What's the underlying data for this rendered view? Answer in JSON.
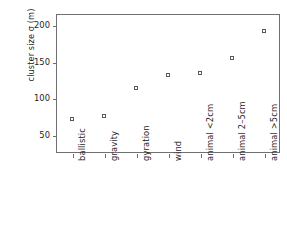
{
  "chart_data": {
    "type": "scatter",
    "title": "",
    "xlabel": "",
    "ylabel": "cluster size σ (m)",
    "categories": [
      "ballistic",
      "gravity",
      "gyration",
      "wind",
      "animal <2cm",
      "animal 2–5cm",
      "animal >5cm"
    ],
    "values": [
      72,
      76,
      114,
      132,
      134,
      155,
      192
    ],
    "ytick_labels": [
      "50",
      "100",
      "150",
      "200"
    ],
    "ytick_values": [
      50,
      100,
      150,
      200
    ],
    "ylim": [
      25,
      215
    ],
    "xlim": [
      0.5,
      7.5
    ],
    "grid": false,
    "legend": null,
    "marker": "open-square",
    "marker_color": "#5a5a5a"
  },
  "figure": {
    "background_color": "#ffffff",
    "axis_color": "#6f6f6f",
    "text_color": "#262626"
  }
}
